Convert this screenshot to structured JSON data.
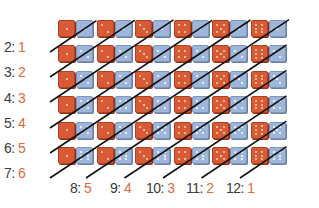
{
  "grid": {
    "rows": 6,
    "cols": 6,
    "red_values_by_col": [
      1,
      2,
      3,
      4,
      5,
      6
    ],
    "blue_values_by_row": [
      1,
      2,
      3,
      4,
      5,
      6
    ],
    "colors": {
      "red_die": "#d95a36",
      "blue_die": "#9db6da",
      "number": "#e06a3c",
      "label": "#3a3a3a",
      "line": "#111111"
    }
  },
  "left_labels": [
    {
      "sum": "2:",
      "count": "1"
    },
    {
      "sum": "3:",
      "count": "2"
    },
    {
      "sum": "4:",
      "count": "3"
    },
    {
      "sum": "5:",
      "count": "4"
    },
    {
      "sum": "6:",
      "count": "5"
    },
    {
      "sum": "7:",
      "count": "6"
    }
  ],
  "bottom_labels": [
    {
      "sum": "8:",
      "count": "5"
    },
    {
      "sum": "9:",
      "count": "4"
    },
    {
      "sum": "10:",
      "count": "3"
    },
    {
      "sum": "11:",
      "count": "2"
    },
    {
      "sum": "12:",
      "count": "1"
    }
  ]
}
